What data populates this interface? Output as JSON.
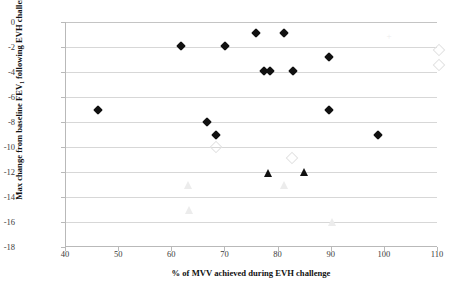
{
  "chart_data": {
    "type": "scatter",
    "title": "",
    "xlabel": "% of MVV achieved during  EVH challenge",
    "ylabel": "Max change from  baseline FEV₁ following EVH challenge (%)",
    "xlim": [
      40,
      110
    ],
    "ylim": [
      -18,
      0
    ],
    "xticks": [
      40,
      50,
      60,
      70,
      80,
      90,
      100,
      110
    ],
    "yticks": [
      0,
      -2,
      -4,
      -6,
      -8,
      -10,
      -12,
      -14,
      -16,
      -18
    ],
    "grid": "horizontal",
    "legend": "none",
    "series": [
      {
        "name": "filled-diamond",
        "marker": "diamond-filled",
        "points": [
          {
            "x": 46.0,
            "y": -7.0
          },
          {
            "x": 61.7,
            "y": -1.9
          },
          {
            "x": 66.6,
            "y": -8.0
          },
          {
            "x": 68.2,
            "y": -9.0
          },
          {
            "x": 70.0,
            "y": -1.9
          },
          {
            "x": 75.7,
            "y": -0.9
          },
          {
            "x": 77.3,
            "y": -3.9
          },
          {
            "x": 78.3,
            "y": -3.9
          },
          {
            "x": 81.0,
            "y": -0.9
          },
          {
            "x": 82.8,
            "y": -3.9
          },
          {
            "x": 89.4,
            "y": -2.8
          },
          {
            "x": 89.4,
            "y": -7.0
          },
          {
            "x": 98.8,
            "y": -9.0
          }
        ]
      },
      {
        "name": "filled-triangle",
        "marker": "triangle-filled",
        "points": [
          {
            "x": 78.0,
            "y": -12.1
          },
          {
            "x": 84.8,
            "y": -12.0
          }
        ]
      },
      {
        "name": "open-diamond",
        "marker": "diamond-open",
        "points": [
          {
            "x": 68.3,
            "y": -10.0
          },
          {
            "x": 82.5,
            "y": -10.9
          },
          {
            "x": 110.2,
            "y": -2.2
          },
          {
            "x": 110.2,
            "y": -3.4
          }
        ]
      },
      {
        "name": "open-triangle",
        "marker": "triangle-open",
        "points": [
          {
            "x": 63.0,
            "y": -13.0
          },
          {
            "x": 63.2,
            "y": -15.0
          },
          {
            "x": 81.0,
            "y": -13.0
          },
          {
            "x": 90.0,
            "y": -16.0
          }
        ]
      },
      {
        "name": "faint-plus",
        "marker": "plus-faint",
        "points": [
          {
            "x": 100.8,
            "y": -1.1
          }
        ]
      }
    ]
  }
}
